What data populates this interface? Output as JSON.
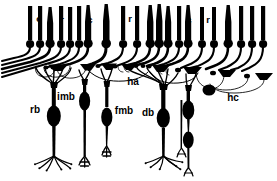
{
  "figure": {
    "background_color": "#ffffff",
    "ink_color": "#000000",
    "width": 277,
    "height": 181
  },
  "labels": {
    "cone_1": "c",
    "rod_1": "r",
    "cone_2": "c",
    "rod_2": "r",
    "cone_3": "c",
    "rod_3": "r",
    "rod_bipolar": "rb",
    "invaginating_midget_bipolar": "imb",
    "flat_midget_bipolar": "fmb",
    "diffuse_bipolar": "db",
    "horizontal_axon": "ha",
    "horizontal_cell": "hc"
  },
  "label_positions": {
    "cone_1": {
      "x": 39,
      "y": 22
    },
    "rod_1": {
      "x": 62,
      "y": 23
    },
    "cone_2": {
      "x": 90,
      "y": 23
    },
    "rod_2": {
      "x": 130,
      "y": 22
    },
    "cone_3": {
      "x": 189,
      "y": 23
    },
    "rod_3": {
      "x": 208,
      "y": 23
    },
    "rod_bipolar": {
      "x": 35,
      "y": 113
    },
    "invaginating_midget_bipolar": {
      "x": 64,
      "y": 100
    },
    "flat_midget_bipolar": {
      "x": 113,
      "y": 114
    },
    "diffuse_bipolar": {
      "x": 148,
      "y": 116
    },
    "horizontal_axon": {
      "x": 131,
      "y": 85
    },
    "horizontal_cell": {
      "x": 230,
      "y": 101
    }
  },
  "structures": {
    "photoreceptors": {
      "rod_count": 16,
      "cone_count": 9,
      "description": "Rod outer segments drawn as thin vertical bars; cone outer segments drawn as tapered cones. Each has a round cell body below."
    },
    "bipolar_cells": [
      {
        "name": "rb",
        "full": "rod bipolar"
      },
      {
        "name": "imb",
        "full": "invaginating midget bipolar"
      },
      {
        "name": "fmb",
        "full": "flat midget bipolar"
      },
      {
        "name": "db",
        "full": "diffuse bipolar"
      }
    ],
    "horizontal_cells": [
      {
        "name": "hc",
        "full": "horizontal cell"
      },
      {
        "name": "ha",
        "full": "horizontal cell axon"
      }
    ]
  }
}
